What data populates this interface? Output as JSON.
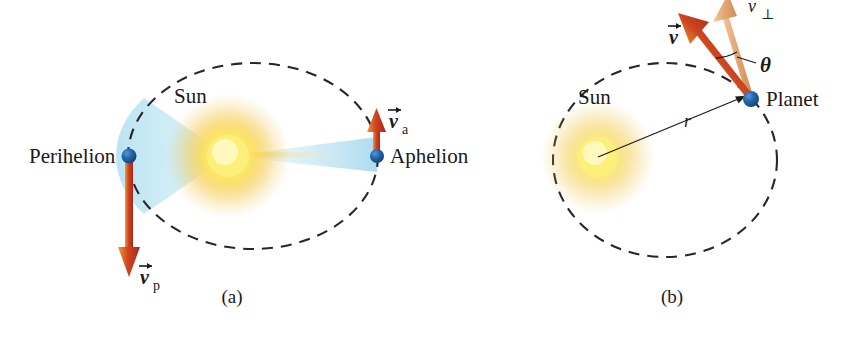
{
  "figure": {
    "background_color": "#ffffff",
    "orbit_stroke_color": "#26262b",
    "sun_core_color": "#fdf07a",
    "sun_glow_color": "#f2c33c",
    "planet_dot_color": "#1f5fa8",
    "velocity_vector_color": "#c0392b",
    "velocity_vector_highlight": "#e8a33d",
    "perp_vector_color": "#e0a878",
    "swept_area_color": "#bfe4f2",
    "radius_line_color": "#1a1a1a"
  },
  "panels": [
    {
      "id": "panel-a",
      "caption": "(a)",
      "sun_label": "Sun",
      "labels": {
        "perihelion": "Perihelion",
        "aphelion": "Aphelion"
      },
      "vectors": [
        {
          "name": "velocity-at-perihelion",
          "symbol": "v",
          "subscript": "p",
          "direction": "down",
          "color": "#c0392b"
        },
        {
          "name": "velocity-at-aphelion",
          "symbol": "v",
          "subscript": "a",
          "direction": "up",
          "color": "#c0392b"
        }
      ]
    },
    {
      "id": "panel-b",
      "caption": "(b)",
      "sun_label": "Sun",
      "labels": {
        "planet": "Planet",
        "radius": "r",
        "angle": "θ"
      },
      "vectors": [
        {
          "name": "velocity",
          "symbol": "v",
          "subscript": "",
          "direction": "up-left",
          "color": "#c0392b"
        },
        {
          "name": "perpendicular-velocity-component",
          "symbol": "v",
          "subscript": "⊥",
          "direction": "up",
          "color": "#e0a878"
        }
      ]
    }
  ]
}
